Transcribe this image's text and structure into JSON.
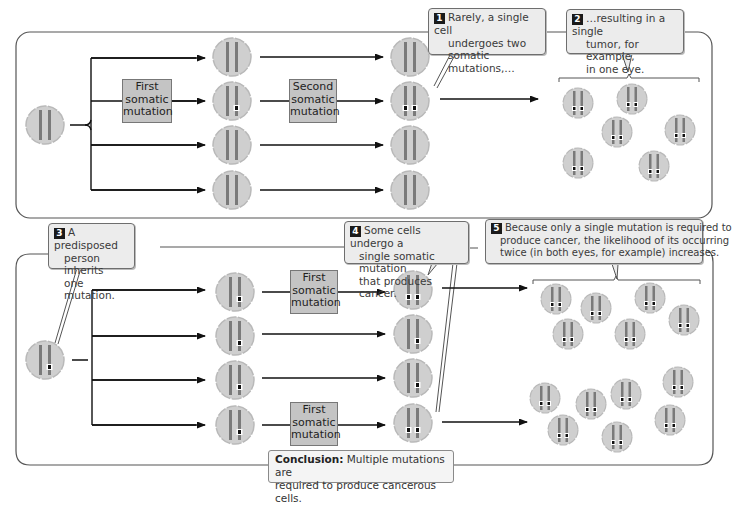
{
  "figure": {
    "colors": {
      "cell_fill": "#cfcfcf",
      "cell_border": "#b8b8b8",
      "chromosome": "#7a7a7a",
      "mutation_mark": "#111111",
      "mutation_box_fill": "#c4c4c4",
      "callout_fill": "#ececec",
      "panel_border": "#555555",
      "badge_fill": "#1a1a1a"
    }
  },
  "top_panel": {
    "label": "Sporadic case (no inherited mutation)",
    "start_cell": {
      "mutations": 0
    },
    "column1_cells": [
      {
        "mutations": 0
      },
      {
        "mutations": 1
      },
      {
        "mutations": 0
      },
      {
        "mutations": 0
      }
    ],
    "column2_cells": [
      {
        "mutations": 0
      },
      {
        "mutations": 2
      },
      {
        "mutations": 0
      },
      {
        "mutations": 0
      }
    ],
    "mutation_boxes": [
      {
        "id": "first",
        "text": "First somatic mutation",
        "lines": [
          "First",
          "somatic",
          "mutation"
        ]
      },
      {
        "id": "second",
        "text": "Second somatic mutation",
        "lines": [
          "Second",
          "somatic",
          "mutation"
        ]
      }
    ],
    "tumor_cell_count": 6,
    "callouts": [
      {
        "number": "1",
        "text": "Rarely, a single cell undergoes two somatic mutations,…",
        "lines": [
          "Rarely, a single cell",
          "undergoes two",
          "somatic mutations,…"
        ]
      },
      {
        "number": "2",
        "text": "…resulting in a single tumor, for example, in one eye.",
        "lines": [
          "…resulting in a single",
          "tumor, for example,",
          "in one eye."
        ]
      }
    ]
  },
  "bottom_panel": {
    "label": "Predisposed case (inherited mutation)",
    "start_cell": {
      "mutations": 1
    },
    "column1_cells": [
      {
        "mutations": 1
      },
      {
        "mutations": 1
      },
      {
        "mutations": 1
      },
      {
        "mutations": 1
      }
    ],
    "column2_cells": [
      {
        "mutations": 2
      },
      {
        "mutations": 1
      },
      {
        "mutations": 1
      },
      {
        "mutations": 2
      }
    ],
    "mutation_boxes": [
      {
        "id": "first-a",
        "text": "First somatic mutation",
        "lines": [
          "First",
          "somatic",
          "mutation"
        ]
      },
      {
        "id": "first-b",
        "text": "First somatic mutation",
        "lines": [
          "First",
          "somatic",
          "mutation"
        ]
      }
    ],
    "tumor_group_upper_count": 6,
    "tumor_group_lower_count": 8,
    "callouts": [
      {
        "number": "3",
        "text": "A predisposed person inherits one mutation.",
        "lines": [
          "A predisposed",
          "person inherits",
          "one mutation."
        ]
      },
      {
        "number": "4",
        "text": "Some cells undergo a single somatic mutation that produces cancer.",
        "lines": [
          "Some cells undergo a",
          "single somatic mutation",
          "that produces cancer."
        ]
      },
      {
        "number": "5",
        "text": "Because only a single mutation is required to produce cancer, the likelihood of its occurring twice (in both eyes, for example) increases.",
        "lines": [
          "Because only a single mutation is required to",
          "produce cancer, the likelihood of its occurring",
          "twice (in both eyes, for example) increases."
        ]
      }
    ]
  },
  "conclusion": {
    "label": "Conclusion:",
    "line1": " Multiple mutations are",
    "line2": "required to produce cancerous cells."
  }
}
